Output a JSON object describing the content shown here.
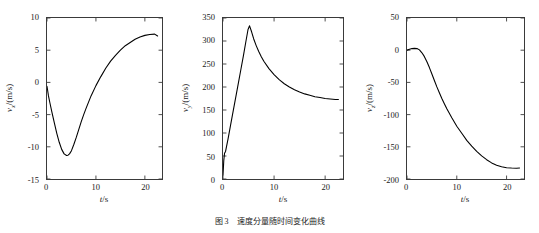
{
  "figure": {
    "caption": "图 3　速度分量随时间变化曲线",
    "caption_label": "图 3"
  },
  "panels": [
    {
      "name": "vx",
      "ylabel_var": "v",
      "ylabel_sub": "x",
      "ylabel_unit": "/(m/s)",
      "xlabel_var": "t",
      "xlabel_unit": "/s",
      "yticks": [
        "10",
        "5",
        "0",
        "-5",
        "-10",
        "-15"
      ],
      "xticks": [
        "0",
        "10",
        "20"
      ]
    },
    {
      "name": "vy",
      "ylabel_var": "v",
      "ylabel_sub": "y",
      "ylabel_unit": "/(m/s)",
      "xlabel_var": "t",
      "xlabel_unit": "/s",
      "yticks": [
        "350",
        "300",
        "250",
        "200",
        "150",
        "100",
        "50",
        "0"
      ],
      "xticks": [
        "0",
        "10",
        "20"
      ]
    },
    {
      "name": "vz",
      "ylabel_var": "v",
      "ylabel_sub": "z",
      "ylabel_unit": "/(m/s)",
      "xlabel_var": "t",
      "xlabel_unit": "/s",
      "yticks": [
        "50",
        "0",
        "-50",
        "-100",
        "-150",
        "-200"
      ],
      "xticks": [
        "0",
        "10",
        "20"
      ]
    }
  ],
  "chart_data": [
    {
      "type": "line",
      "title": "",
      "xlabel": "t/s",
      "ylabel": "v_x/(m/s)",
      "xlim": [
        0,
        23.5
      ],
      "ylim": [
        -15,
        10
      ],
      "xticks": [
        0,
        10,
        20
      ],
      "yticks": [
        -15,
        -10,
        -5,
        0,
        5,
        10
      ],
      "grid": false,
      "legend": "none",
      "line_color": "#000000",
      "x": [
        0,
        0.3,
        0.6,
        1.0,
        1.5,
        2.0,
        2.5,
        3.0,
        3.5,
        4.0,
        4.3,
        4.6,
        5.0,
        5.5,
        6.0,
        6.5,
        7.0,
        7.5,
        8.0,
        9.0,
        10.0,
        11.0,
        12.0,
        13.0,
        14.0,
        15.0,
        16.0,
        17.0,
        18.0,
        19.0,
        20.0,
        21.0,
        22.0,
        22.6
      ],
      "y": [
        -0.6,
        -2.1,
        -3.2,
        -4.6,
        -6.3,
        -7.9,
        -9.3,
        -10.4,
        -11.1,
        -11.35,
        -11.3,
        -11.1,
        -10.6,
        -9.6,
        -8.5,
        -7.3,
        -6.1,
        -5.0,
        -4.0,
        -2.1,
        -0.5,
        0.9,
        2.2,
        3.3,
        4.2,
        5.0,
        5.7,
        6.2,
        6.7,
        7.05,
        7.3,
        7.45,
        7.5,
        7.2
      ]
    },
    {
      "type": "line",
      "title": "",
      "xlabel": "t/s",
      "ylabel": "v_y/(m/s)",
      "xlim": [
        0,
        23.5
      ],
      "ylim": [
        0,
        350
      ],
      "xticks": [
        0,
        10,
        20
      ],
      "yticks": [
        0,
        50,
        100,
        150,
        200,
        250,
        300,
        350
      ],
      "grid": false,
      "legend": "none",
      "line_color": "#000000",
      "x": [
        0,
        0.15,
        0.3,
        0.5,
        1.0,
        1.5,
        2.0,
        2.5,
        3.0,
        3.5,
        4.0,
        4.5,
        4.9,
        5.2,
        5.6,
        6.0,
        6.5,
        7.0,
        7.5,
        8.0,
        9.0,
        10.0,
        11.0,
        12.0,
        13.0,
        14.0,
        15.0,
        16.0,
        17.0,
        18.0,
        19.0,
        20.0,
        21.0,
        22.0,
        22.6
      ],
      "y": [
        8,
        40,
        56,
        60,
        88,
        118,
        148,
        178,
        208,
        238,
        268,
        300,
        325,
        333,
        320,
        305,
        290,
        277,
        266,
        256,
        240,
        227,
        216,
        207,
        200,
        194,
        189,
        185,
        182,
        179,
        177,
        175,
        174,
        173,
        173
      ]
    },
    {
      "type": "line",
      "title": "",
      "xlabel": "t/s",
      "ylabel": "v_z/(m/s)",
      "xlim": [
        0,
        23.5
      ],
      "ylim": [
        -200,
        50
      ],
      "xticks": [
        0,
        10,
        20
      ],
      "yticks": [
        -200,
        -150,
        -100,
        -50,
        0,
        50
      ],
      "grid": false,
      "legend": "none",
      "line_color": "#000000",
      "x": [
        0,
        0.5,
        1.0,
        1.5,
        2.0,
        2.5,
        3.0,
        3.5,
        4.0,
        4.5,
        5.0,
        5.5,
        6.0,
        6.5,
        7.0,
        7.5,
        8.0,
        9.0,
        10.0,
        11.0,
        12.0,
        13.0,
        14.0,
        15.0,
        16.0,
        17.0,
        18.0,
        19.0,
        20.0,
        21.0,
        22.0,
        22.6
      ],
      "y": [
        0,
        1.5,
        2.5,
        2.8,
        2.5,
        0.5,
        -4.0,
        -10.0,
        -18.0,
        -27.0,
        -37.0,
        -47.0,
        -57.0,
        -66.0,
        -75.0,
        -83.0,
        -91.0,
        -105.0,
        -118.0,
        -129.0,
        -140.0,
        -149.0,
        -157.0,
        -164.0,
        -170.0,
        -175.0,
        -178.5,
        -181.0,
        -182.5,
        -183.0,
        -183.2,
        -183.0
      ]
    }
  ]
}
